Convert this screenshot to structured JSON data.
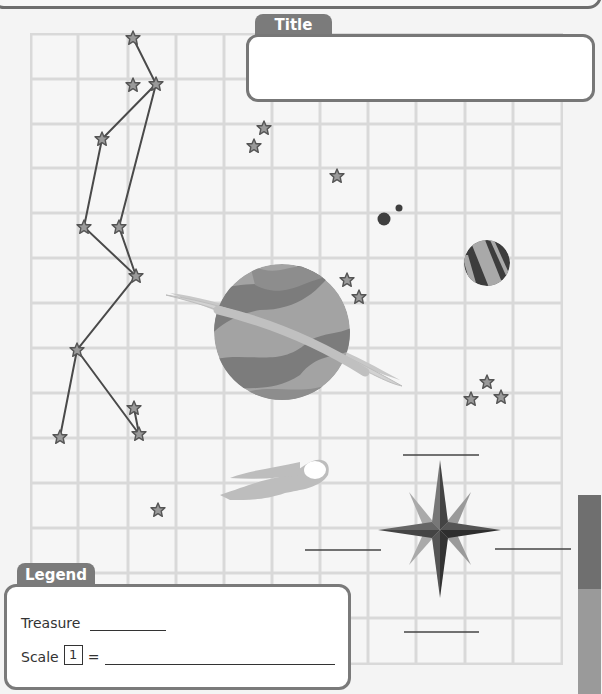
{
  "worksheet": {
    "title_label": "Title",
    "title_value": "",
    "legend": {
      "label": "Legend",
      "treasure_label": "Treasure",
      "treasure_value": "",
      "scale_label": "Scale",
      "scale_unit": "1",
      "scale_equals": "=",
      "scale_value": ""
    },
    "compass": {
      "north_blank": "",
      "south_blank": "",
      "east_blank": "",
      "west_blank": ""
    },
    "grid": {
      "columns": 11,
      "rows": 14
    },
    "map_features": [
      "constellation",
      "ringed-planet",
      "small-striped-planet",
      "comet",
      "asteroids",
      "star-cluster",
      "compass-rose"
    ]
  },
  "colors": {
    "frame": "#777777",
    "tab": "#7b7b7b",
    "grid_line": "#d9d9d9",
    "planet_dark": "#7a7a7a",
    "planet_light": "#a8a8a8",
    "ring": "#c4c4c4",
    "compass_dark": "#3a3a3a",
    "star_fill": "#9a9a9a"
  }
}
